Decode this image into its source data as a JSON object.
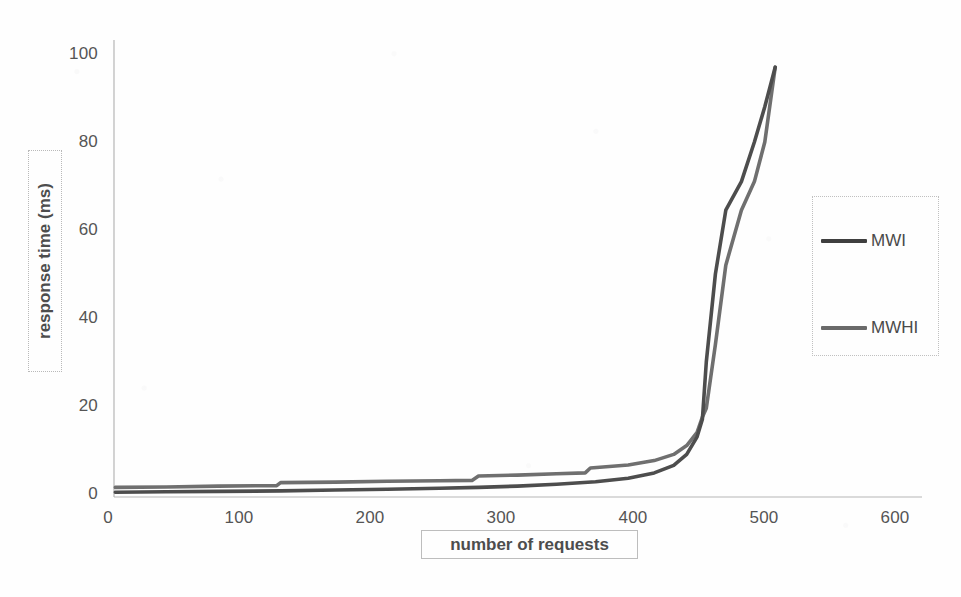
{
  "chart_data": {
    "type": "line",
    "title": "",
    "xlabel": "number of requests",
    "ylabel": "response time (ms)",
    "xlim": [
      0,
      600
    ],
    "ylim": [
      0,
      100
    ],
    "xticks": [
      0,
      100,
      200,
      300,
      400,
      500,
      600
    ],
    "yticks": [
      0,
      20,
      40,
      60,
      80,
      100
    ],
    "grid": false,
    "legend_position": "right",
    "series": [
      {
        "name": "MWI",
        "color": "#4d4d4d",
        "x": [
          1,
          40,
          80,
          128,
          170,
          210,
          250,
          280,
          310,
          340,
          370,
          395,
          415,
          430,
          440,
          448,
          452,
          455,
          462,
          470,
          482,
          492,
          500,
          508
        ],
        "y": [
          0.4,
          0.5,
          0.6,
          0.7,
          0.9,
          1.1,
          1.3,
          1.5,
          1.8,
          2.2,
          2.8,
          3.6,
          4.8,
          6.5,
          9.0,
          13.0,
          17.0,
          30.0,
          50.0,
          64.5,
          71.0,
          80.0,
          88.0,
          97.0
        ]
      },
      {
        "name": "MWHI",
        "color": "#6f6f6f",
        "x": [
          1,
          40,
          80,
          125,
          128,
          170,
          210,
          250,
          275,
          280,
          310,
          340,
          362,
          366,
          395,
          415,
          430,
          440,
          448,
          452,
          455,
          462,
          470,
          482,
          492,
          500,
          508
        ],
        "y": [
          1.5,
          1.6,
          1.8,
          1.9,
          2.6,
          2.7,
          2.9,
          3.0,
          3.1,
          4.1,
          4.3,
          4.6,
          4.8,
          5.9,
          6.6,
          7.6,
          9.0,
          11.0,
          14.0,
          17.5,
          19.5,
          34.0,
          52.0,
          64.5,
          71.0,
          80.0,
          97.0
        ]
      }
    ]
  },
  "axes": {
    "y_tick_labels": [
      "100",
      "80",
      "60",
      "40",
      "20",
      "0"
    ],
    "x_tick_labels": [
      "0",
      "100",
      "200",
      "300",
      "400",
      "500",
      "600"
    ],
    "y_title": "response time (ms)",
    "x_title": "number of requests"
  },
  "legend": {
    "entries": [
      {
        "label": "MWI",
        "color": "#3f3f3f"
      },
      {
        "label": "MWHI",
        "color": "#6a6a6a"
      }
    ]
  },
  "colors": {
    "axis_line": "#b5b5b5",
    "background": "#fefefe",
    "tick_text": "#555555",
    "series_mwi": "#4d4d4d",
    "series_mwhi": "#707070"
  }
}
